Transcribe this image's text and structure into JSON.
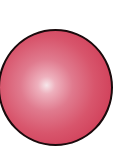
{
  "image": {
    "subject": "glossy red sphere",
    "colors": {
      "background": "#ffffff",
      "sphere_base": "#d8556c",
      "highlight": "#f6e6ea",
      "outline": "#1a0a0c"
    }
  }
}
